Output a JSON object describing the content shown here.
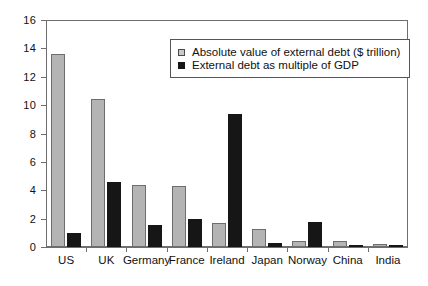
{
  "chart_data": {
    "type": "bar",
    "title": "",
    "xlabel": "",
    "ylabel": "",
    "ylim": [
      0,
      16
    ],
    "yticks": [
      0,
      2,
      4,
      6,
      8,
      10,
      12,
      14,
      16
    ],
    "grid": false,
    "legend_position": "top-center",
    "categories": [
      "US",
      "UK",
      "Germany",
      "France",
      "Ireland",
      "Japan",
      "Norway",
      "China",
      "India"
    ],
    "series": [
      {
        "name": "Absolute value of external debt ($ trillion)",
        "color": "#b4b4b4",
        "values": [
          13.6,
          10.4,
          4.4,
          4.3,
          1.7,
          1.3,
          0.45,
          0.45,
          0.2
        ]
      },
      {
        "name": "External debt as multiple of GDP",
        "color": "#161616",
        "values": [
          1.0,
          4.6,
          1.55,
          2.0,
          9.4,
          0.3,
          1.75,
          0.05,
          0.08
        ]
      }
    ]
  },
  "legend": {
    "items": [
      {
        "label": "Absolute value of external debt ($ trillion)",
        "swatch": "grey"
      },
      {
        "label": "External debt as multiple of GDP",
        "swatch": "black"
      }
    ]
  }
}
